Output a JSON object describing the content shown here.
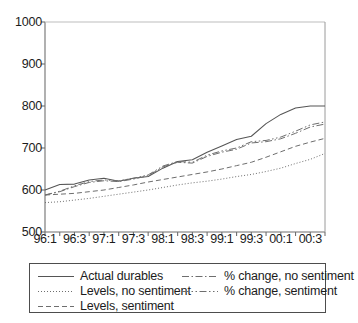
{
  "chart_data": {
    "type": "line",
    "title": "",
    "subtitle": "",
    "xlabel": "",
    "ylabel": "",
    "ylim": [
      500,
      1000
    ],
    "yticks": [
      500,
      600,
      700,
      800,
      900,
      1000
    ],
    "ytick_labels": [
      "500",
      "600",
      "700",
      "800",
      "900",
      "1000"
    ],
    "grid": false,
    "legend_position": "bottom",
    "x": [
      "96:1",
      "96:2",
      "96:3",
      "96:4",
      "97:1",
      "97:2",
      "97:3",
      "97:4",
      "98:1",
      "98:2",
      "98:3",
      "98:4",
      "99:1",
      "99:2",
      "99:3",
      "99:4",
      "00:1",
      "00:2",
      "00:3",
      "00:4"
    ],
    "xtick_labels": [
      "96:1",
      "96:3",
      "97:1",
      "97:3",
      "98:1",
      "98:3",
      "99:1",
      "99:3",
      "00:1",
      "00:3"
    ],
    "xtick_indices": [
      0,
      2,
      4,
      6,
      8,
      10,
      12,
      14,
      16,
      18
    ],
    "series": [
      {
        "name": "Actual durables",
        "style": "solid",
        "color": "#555555",
        "values": [
          600,
          613,
          614,
          624,
          628,
          621,
          628,
          632,
          652,
          668,
          672,
          690,
          705,
          720,
          728,
          758,
          780,
          795,
          800,
          800
        ]
      },
      {
        "name": "Levels, no sentiment",
        "style": "dotted",
        "color": "#6e6e6e",
        "values": [
          570,
          572,
          576,
          580,
          585,
          590,
          595,
          600,
          606,
          612,
          617,
          621,
          626,
          632,
          637,
          644,
          652,
          663,
          673,
          687
        ]
      },
      {
        "name": "Levels, sentiment",
        "style": "dashed",
        "color": "#6e6e6e",
        "values": [
          588,
          590,
          592,
          596,
          600,
          606,
          612,
          619,
          625,
          631,
          637,
          643,
          650,
          658,
          666,
          678,
          691,
          704,
          714,
          723
        ]
      },
      {
        "name": "% change, no sentiment",
        "style": "dashdot",
        "color": "#6e6e6e",
        "values": [
          588,
          596,
          608,
          618,
          622,
          620,
          626,
          634,
          655,
          666,
          664,
          680,
          690,
          697,
          712,
          715,
          722,
          735,
          750,
          757
        ]
      },
      {
        "name": "% change, sentiment",
        "style": "dashdotdot",
        "color": "#6e6e6e",
        "values": [
          588,
          597,
          610,
          620,
          624,
          622,
          628,
          636,
          657,
          668,
          666,
          683,
          693,
          700,
          715,
          718,
          726,
          740,
          755,
          762
        ]
      }
    ],
    "axis_color": "#707070"
  },
  "legend": {
    "entries": [
      {
        "label": "Actual durables",
        "style": "solid"
      },
      {
        "label": "Levels, no sentiment",
        "style": "dotted"
      },
      {
        "label": "Levels, sentiment",
        "style": "dashed"
      },
      {
        "label": "% change, no sentiment",
        "style": "dashdot"
      },
      {
        "label": "% change, sentiment",
        "style": "dashdotdot"
      }
    ]
  }
}
